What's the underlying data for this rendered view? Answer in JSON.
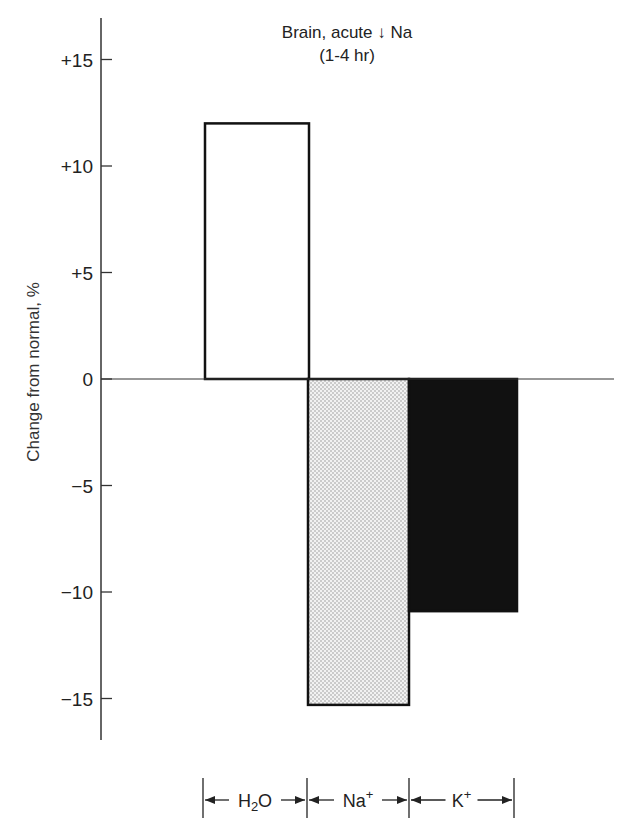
{
  "chart_data": {
    "type": "bar",
    "title": "Brain, acute ↓ Na",
    "subtitle": "(1-4 hr)",
    "xlabel": "",
    "ylabel": "Change from normal, %",
    "categories": [
      "H2O",
      "Na+",
      "K+"
    ],
    "category_labels": [
      {
        "base": "H",
        "sub": "2",
        "rest": "O",
        "sup": ""
      },
      {
        "base": "Na",
        "sub": "",
        "rest": "",
        "sup": "+"
      },
      {
        "base": "K",
        "sub": "",
        "rest": "",
        "sup": "+"
      }
    ],
    "values": [
      12,
      -15.3,
      -10.9
    ],
    "fills": [
      "white",
      "stippled-gray",
      "black"
    ],
    "ylim": [
      -17,
      17
    ],
    "yticks": [
      15,
      10,
      5,
      0,
      -5,
      -10,
      -15
    ],
    "ytick_labels": [
      "+15",
      "+10",
      "+5",
      "0",
      "−5",
      "−10",
      "−15"
    ],
    "grid": false,
    "legend": "none"
  }
}
